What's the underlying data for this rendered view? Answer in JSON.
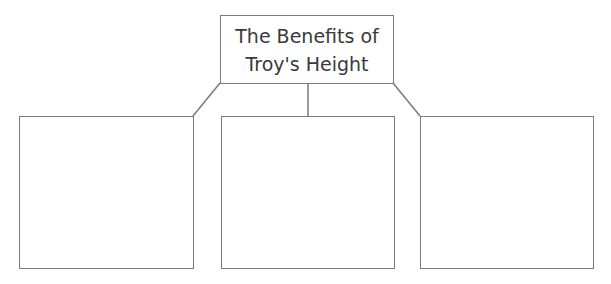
{
  "diagram": {
    "title": "The Benefits of\nTroy's Height",
    "branches": [
      {
        "position": "left",
        "text": ""
      },
      {
        "position": "middle",
        "text": ""
      },
      {
        "position": "right",
        "text": ""
      }
    ],
    "line_color": "#7a7a7a"
  }
}
